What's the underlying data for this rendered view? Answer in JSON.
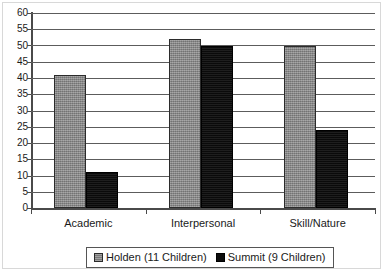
{
  "chart_data": {
    "type": "bar",
    "title": "",
    "subtitle": "",
    "xlabel": "",
    "ylabel": "",
    "categories": [
      "Academic",
      "Interpersonal",
      "Skill/Nature"
    ],
    "series": [
      {
        "name": "Holden (11 Children)",
        "color": "#8a8a8a",
        "values": [
          41,
          52,
          50
        ]
      },
      {
        "name": "Summit (9 Children)",
        "color": "#0d0d0d",
        "values": [
          11,
          50,
          24
        ]
      }
    ],
    "ylim": [
      0,
      60
    ],
    "ytick_step": 5,
    "yticks": [
      60,
      55,
      50,
      45,
      40,
      35,
      30,
      25,
      20,
      15,
      10,
      5,
      0
    ],
    "ytick_labels": [
      "60",
      "55",
      "50",
      "45",
      "40",
      "35",
      "30",
      "25",
      "20",
      "15",
      "10",
      "5",
      "0"
    ],
    "grid": true,
    "grid_axis": "y",
    "legend_position": "bottom",
    "legend": [
      {
        "label": "Holden (11 Children)",
        "swatch": "gray-square-swatch"
      },
      {
        "label": "Summit (9 Children)",
        "swatch": "black-square-swatch"
      }
    ]
  },
  "axes": {
    "y_axis_name": "value-axis",
    "x_axis_name": "category-axis"
  }
}
